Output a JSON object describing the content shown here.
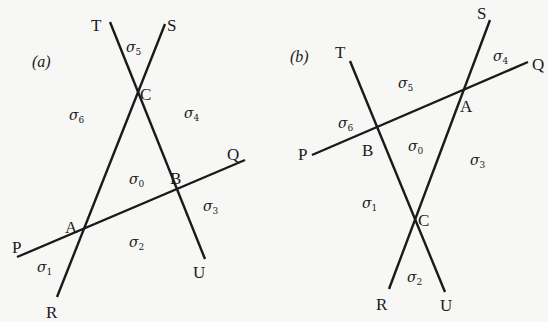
{
  "figure": {
    "panels": [
      {
        "id": "a",
        "label": "(a)",
        "label_pos": [
          32,
          67
        ],
        "lines": [
          {
            "name": "line-PQ",
            "from": [
              17,
              257
            ],
            "to": [
              245,
              160
            ]
          },
          {
            "name": "line-RS",
            "from": [
              57,
              297
            ],
            "to": [
              165,
              24
            ]
          },
          {
            "name": "line-TU",
            "from": [
              110,
              22
            ],
            "to": [
              205,
              259
            ]
          }
        ],
        "points": [
          {
            "name": "T",
            "text": "T",
            "pos": [
              91,
              31
            ]
          },
          {
            "name": "S",
            "text": "S",
            "pos": [
              167,
              31
            ]
          },
          {
            "name": "C",
            "text": "C",
            "pos": [
              140,
              100
            ]
          },
          {
            "name": "Q",
            "text": "Q",
            "pos": [
              227,
              160
            ]
          },
          {
            "name": "B",
            "text": "B",
            "pos": [
              170,
              184
            ]
          },
          {
            "name": "A",
            "text": "A",
            "pos": [
              65,
              233
            ]
          },
          {
            "name": "P",
            "text": "P",
            "pos": [
              12,
              253
            ]
          },
          {
            "name": "U",
            "text": "U",
            "pos": [
              193,
              278
            ]
          },
          {
            "name": "R",
            "text": "R",
            "pos": [
              46,
              318
            ]
          }
        ],
        "regions": [
          {
            "name": "sigma-5",
            "symbol": "σ",
            "index": "5",
            "pos": [
              126,
              52
            ]
          },
          {
            "name": "sigma-6",
            "symbol": "σ",
            "index": "6",
            "pos": [
              69,
              120
            ]
          },
          {
            "name": "sigma-4",
            "symbol": "σ",
            "index": "4",
            "pos": [
              184,
              118
            ]
          },
          {
            "name": "sigma-0",
            "symbol": "σ",
            "index": "0",
            "pos": [
              129,
              184
            ]
          },
          {
            "name": "sigma-3",
            "symbol": "σ",
            "index": "3",
            "pos": [
              203,
              211
            ]
          },
          {
            "name": "sigma-2",
            "symbol": "σ",
            "index": "2",
            "pos": [
              129,
              247
            ]
          },
          {
            "name": "sigma-1",
            "symbol": "σ",
            "index": "1",
            "pos": [
              37,
              272
            ]
          }
        ]
      },
      {
        "id": "b",
        "label": "(b)",
        "label_pos": [
          290,
          62
        ],
        "lines": [
          {
            "name": "line-PQ",
            "from": [
              312,
              155
            ],
            "to": [
              528,
              62
            ]
          },
          {
            "name": "line-RS",
            "from": [
              389,
              289
            ],
            "to": [
              490,
              20
            ]
          },
          {
            "name": "line-TU",
            "from": [
              350,
              61
            ],
            "to": [
              445,
              292
            ]
          }
        ],
        "points": [
          {
            "name": "S",
            "text": "S",
            "pos": [
              477,
              19
            ]
          },
          {
            "name": "T",
            "text": "T",
            "pos": [
              335,
              58
            ]
          },
          {
            "name": "Q",
            "text": "Q",
            "pos": [
              532,
              70
            ]
          },
          {
            "name": "A",
            "text": "A",
            "pos": [
              460,
              112
            ]
          },
          {
            "name": "B",
            "text": "B",
            "pos": [
              362,
              156
            ]
          },
          {
            "name": "P",
            "text": "P",
            "pos": [
              298,
              160
            ]
          },
          {
            "name": "C",
            "text": "C",
            "pos": [
              418,
              226
            ]
          },
          {
            "name": "R",
            "text": "R",
            "pos": [
              376,
              310
            ]
          },
          {
            "name": "U",
            "text": "U",
            "pos": [
              440,
              311
            ]
          }
        ],
        "regions": [
          {
            "name": "sigma-4",
            "symbol": "σ",
            "index": "4",
            "pos": [
              493,
              61
            ]
          },
          {
            "name": "sigma-5",
            "symbol": "σ",
            "index": "5",
            "pos": [
              398,
              88
            ]
          },
          {
            "name": "sigma-6",
            "symbol": "σ",
            "index": "6",
            "pos": [
              338,
              128
            ]
          },
          {
            "name": "sigma-0",
            "symbol": "σ",
            "index": "0",
            "pos": [
              408,
              151
            ]
          },
          {
            "name": "sigma-3",
            "symbol": "σ",
            "index": "3",
            "pos": [
              470,
              165
            ]
          },
          {
            "name": "sigma-1",
            "symbol": "σ",
            "index": "1",
            "pos": [
              362,
              208
            ]
          },
          {
            "name": "sigma-2",
            "symbol": "σ",
            "index": "2",
            "pos": [
              407,
              282
            ]
          }
        ]
      }
    ],
    "colors": {
      "background": "#f7f7f5",
      "ink": "#1a1a1a"
    }
  }
}
